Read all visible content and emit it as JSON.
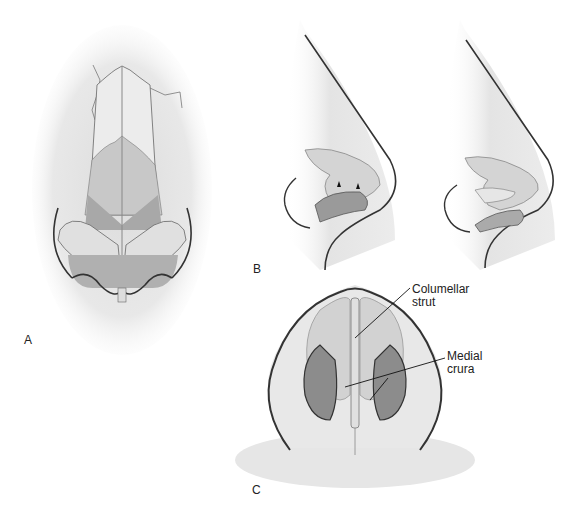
{
  "figure": {
    "panels": [
      {
        "id": "A",
        "label": "A",
        "description": "Frontal view of nose with dorsum and lower lateral cartilages exposed"
      },
      {
        "id": "B",
        "label": "B",
        "description": "Lateral views of nose before and after repositioning"
      },
      {
        "id": "C",
        "label": "C",
        "description": "Basal view of nose showing columellar strut between medial crura"
      }
    ],
    "annotations": [
      {
        "text_line1": "Columellar",
        "text_line2": "strut"
      },
      {
        "text_line1": "Medial",
        "text_line2": "crura"
      }
    ]
  }
}
